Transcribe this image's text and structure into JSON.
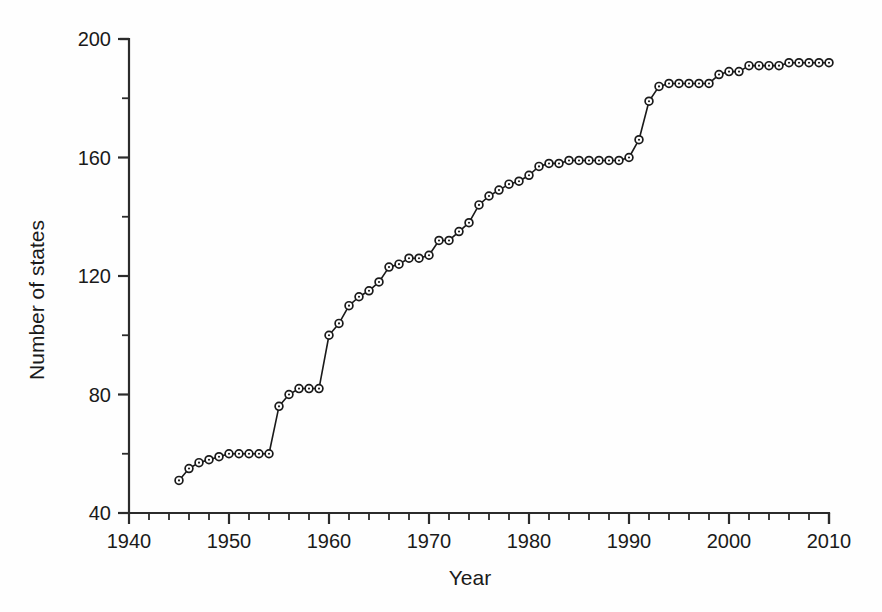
{
  "chart_data": {
    "type": "line",
    "title": "",
    "xlabel": "Year",
    "ylabel": "Number of states",
    "xlim": [
      1940,
      2010
    ],
    "ylim": [
      40,
      200
    ],
    "grid": false,
    "legend": null,
    "marker": "open-circle",
    "x_major_ticks": [
      1940,
      1950,
      1960,
      1970,
      1980,
      1990,
      2000,
      2010
    ],
    "x_major_tick_labels": [
      "1940",
      "1950",
      "1960",
      "1970",
      "1980",
      "1990",
      "2000",
      "2010"
    ],
    "x_minor_tick_step": 2,
    "y_major_ticks": [
      40,
      80,
      120,
      160,
      200
    ],
    "y_major_tick_labels": [
      "40",
      "80",
      "120",
      "160",
      "200"
    ],
    "y_minor_tick_step": 20,
    "series": [
      {
        "name": "Number of states",
        "x": [
          1945,
          1946,
          1947,
          1948,
          1949,
          1950,
          1951,
          1952,
          1953,
          1954,
          1955,
          1956,
          1957,
          1958,
          1959,
          1960,
          1961,
          1962,
          1963,
          1964,
          1965,
          1966,
          1967,
          1968,
          1969,
          1970,
          1971,
          1972,
          1973,
          1974,
          1975,
          1976,
          1977,
          1978,
          1979,
          1980,
          1981,
          1982,
          1983,
          1984,
          1985,
          1986,
          1987,
          1988,
          1989,
          1990,
          1991,
          1992,
          1993,
          1994,
          1995,
          1996,
          1997,
          1998,
          1999,
          2000,
          2001,
          2002,
          2003,
          2004,
          2005,
          2006,
          2007,
          2008,
          2009,
          2010
        ],
        "y": [
          51,
          55,
          57,
          58,
          59,
          60,
          60,
          60,
          60,
          60,
          76,
          80,
          82,
          82,
          82,
          100,
          104,
          110,
          113,
          115,
          118,
          123,
          124,
          126,
          126,
          127,
          132,
          132,
          135,
          138,
          144,
          147,
          149,
          151,
          152,
          154,
          157,
          158,
          158,
          159,
          159,
          159,
          159,
          159,
          159,
          160,
          166,
          179,
          184,
          185,
          185,
          185,
          185,
          185,
          188,
          189,
          189,
          191,
          191,
          191,
          191,
          192,
          192,
          192,
          192,
          192
        ]
      }
    ]
  },
  "figure": {
    "background_color": "#fefefe",
    "line_color": "#1a1a1a",
    "marker_face_color": "#ffffff",
    "axis_color": "#2b2b2b"
  }
}
